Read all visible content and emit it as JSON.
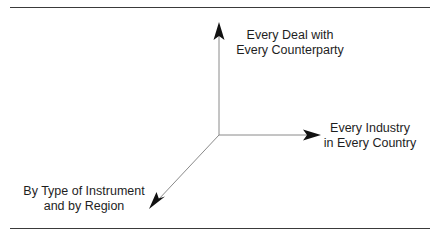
{
  "diagram": {
    "type": "three-axis",
    "origin": {
      "x": 219,
      "y": 135
    },
    "axes": [
      {
        "id": "up",
        "direction": "vertical-up",
        "tip": {
          "x": 218,
          "y": 23
        },
        "label_lines": [
          "Every Deal with",
          "Every Counterparty"
        ]
      },
      {
        "id": "right",
        "direction": "horizontal-right",
        "tip": {
          "x": 320,
          "y": 135
        },
        "label_lines": [
          "Every Industry",
          "in Every Country"
        ]
      },
      {
        "id": "diagonal",
        "direction": "down-left",
        "tip": {
          "x": 150,
          "y": 208
        },
        "label_lines": [
          "By Type of Instrument",
          "and by Region"
        ]
      }
    ],
    "colors": {
      "axis_line": "#8a8a8a",
      "arrowhead": "#111111",
      "rule": "#3a3a3a",
      "text": "#1e1e1e",
      "background": "#ffffff"
    }
  }
}
